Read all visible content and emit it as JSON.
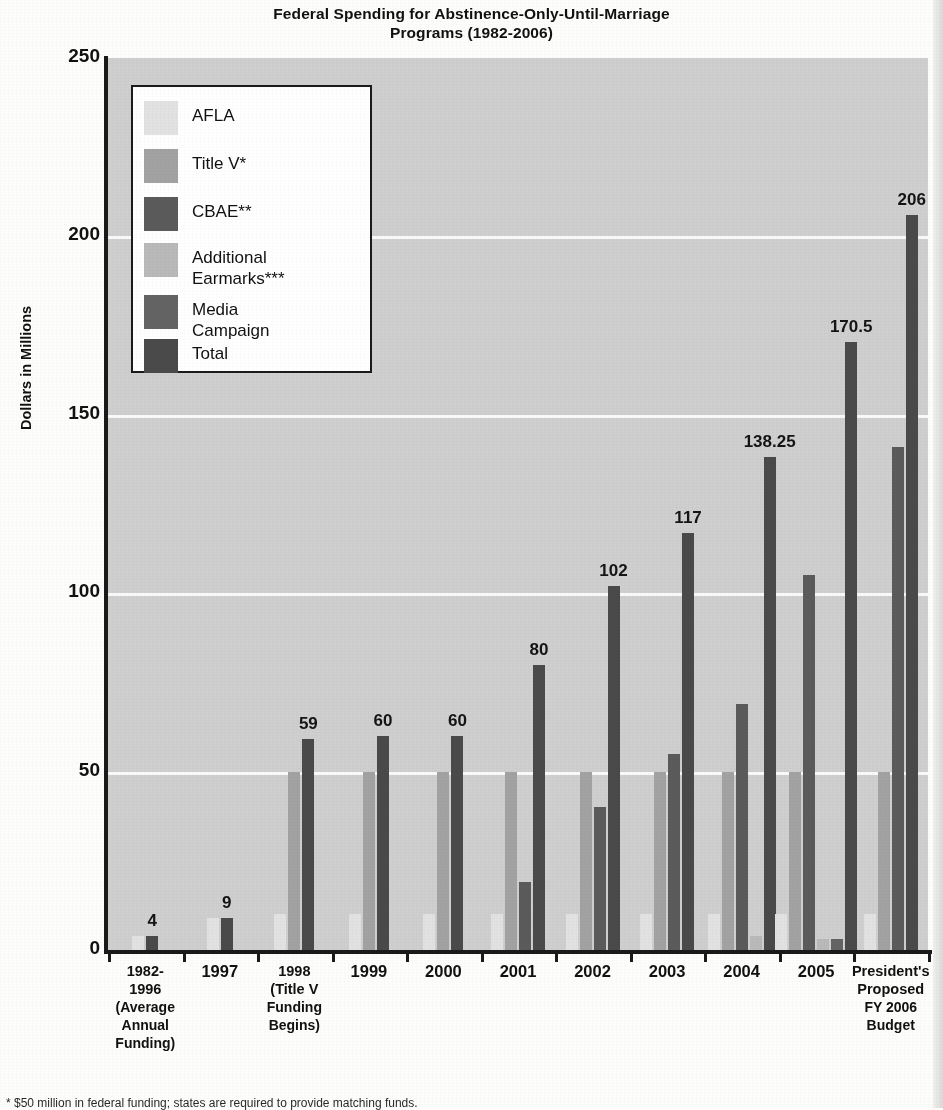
{
  "title": {
    "line1": "Federal Spending for Abstinence-Only-Until-Marriage",
    "line2": "Programs (1982-2006)"
  },
  "axes": {
    "ylabel": "Dollars in Millions",
    "yticks": [
      "0",
      "50",
      "100",
      "150",
      "200",
      "250"
    ]
  },
  "legend": {
    "items": [
      {
        "label": "AFLA",
        "color": "#e2e2e2",
        "key": "afla"
      },
      {
        "label": "Title V*",
        "color": "#a2a2a2",
        "key": "titlev"
      },
      {
        "label": "CBAE**",
        "color": "#5b5b5b",
        "key": "cbae"
      },
      {
        "label": "Additional\nEarmarks***",
        "color": "#b9b9b9",
        "key": "earmark"
      },
      {
        "label": "Media\nCampaign",
        "color": "#646464",
        "key": "media"
      },
      {
        "label": "Total",
        "color": "#4a4a4a",
        "key": "total"
      }
    ]
  },
  "footnote": "* $50 million in federal funding; states are required to provide matching funds.",
  "chart_data": {
    "type": "bar",
    "title": "Federal Spending for Abstinence-Only-Until-Marriage Programs (1982-2006)",
    "xlabel": "",
    "ylabel": "Dollars in Millions",
    "ylim": [
      0,
      250
    ],
    "ytick_values": [
      0,
      50,
      100,
      150,
      200,
      250
    ],
    "grid": "horizontal",
    "legend_position": "inside-top-left",
    "categories": [
      "1982-1996 (Average Annual Funding)",
      "1997",
      "1998 (Title V Funding Begins)",
      "1999",
      "2000",
      "2001",
      "2002",
      "2003",
      "2004",
      "2005",
      "President's Proposed FY 2006 Budget"
    ],
    "category_lines": [
      [
        "1982-",
        "1996",
        "(Average",
        "Annual",
        "Funding)"
      ],
      [
        "1997"
      ],
      [
        "1998",
        "(Title V",
        "Funding",
        "Begins)"
      ],
      [
        "1999"
      ],
      [
        "2000"
      ],
      [
        "2001"
      ],
      [
        "2002"
      ],
      [
        "2003"
      ],
      [
        "2004"
      ],
      [
        "2005"
      ],
      [
        "President's",
        "Proposed",
        "FY 2006",
        "Budget"
      ]
    ],
    "series": [
      {
        "name": "AFLA",
        "key": "afla",
        "color": "#e2e2e2",
        "values": [
          4,
          9,
          10,
          10,
          10,
          10,
          10,
          10,
          10,
          10,
          10
        ]
      },
      {
        "name": "Title V*",
        "key": "titlev",
        "color": "#a2a2a2",
        "values": [
          null,
          null,
          50,
          50,
          50,
          50,
          50,
          50,
          50,
          50,
          50
        ]
      },
      {
        "name": "CBAE**",
        "key": "cbae",
        "color": "#5b5b5b",
        "values": [
          null,
          null,
          null,
          null,
          null,
          19,
          40,
          55,
          69,
          105,
          141
        ]
      },
      {
        "name": "Additional Earmarks***",
        "key": "earmark",
        "color": "#b9b9b9",
        "values": [
          null,
          null,
          null,
          null,
          null,
          null,
          null,
          null,
          4,
          3,
          null
        ]
      },
      {
        "name": "Media Campaign",
        "key": "media",
        "color": "#646464",
        "values": [
          null,
          null,
          null,
          null,
          null,
          null,
          null,
          null,
          null,
          3,
          null
        ]
      },
      {
        "name": "Total",
        "key": "total",
        "color": "#4a4a4a",
        "values": [
          4,
          9,
          59,
          60,
          60,
          80,
          102,
          117,
          138.25,
          170.5,
          206
        ]
      }
    ],
    "total_labels": [
      "4",
      "9",
      "59",
      "60",
      "60",
      "80",
      "102",
      "117",
      "138.25",
      "170.5",
      "206"
    ]
  }
}
